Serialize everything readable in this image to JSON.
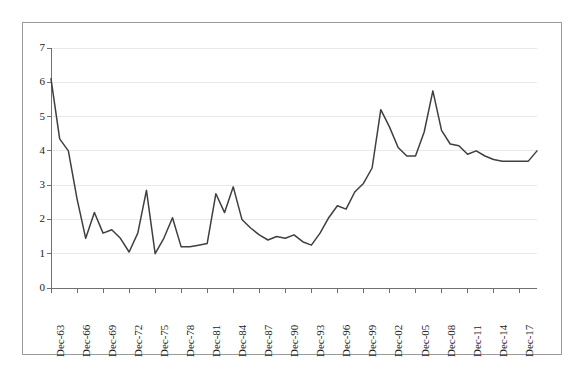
{
  "chart_data": {
    "type": "line",
    "title": "",
    "subtitle": "",
    "xlabel": "",
    "ylabel": "",
    "xlim": [
      "Dec-63",
      "Dec-19"
    ],
    "ylim": [
      0,
      7
    ],
    "y_ticks": [
      0,
      1,
      2,
      3,
      4,
      5,
      6,
      7
    ],
    "grid": "horizontal",
    "legend": "none",
    "line_color": "#3f3f3f",
    "grid_color": "#e9e9e9",
    "axis_color": "#6f6f6f",
    "x_tick_labels": [
      "Dec-63",
      "Dec-66",
      "Dec-69",
      "Dec-72",
      "Dec-75",
      "Dec-78",
      "Dec-81",
      "Dec-84",
      "Dec-87",
      "Dec-90",
      "Dec-93",
      "Dec-96",
      "Dec-99",
      "Dec-02",
      "Dec-05",
      "Dec-08",
      "Dec-11",
      "Dec-14",
      "Dec-17"
    ],
    "x_tick_interval_years": 3,
    "x": [
      "Dec-63",
      "Dec-64",
      "Dec-65",
      "Dec-66",
      "Dec-67",
      "Dec-68",
      "Dec-69",
      "Dec-70",
      "Dec-71",
      "Dec-72",
      "Dec-73",
      "Dec-74",
      "Dec-75",
      "Dec-76",
      "Dec-77",
      "Dec-78",
      "Dec-79",
      "Dec-80",
      "Dec-81",
      "Dec-82",
      "Dec-83",
      "Dec-84",
      "Dec-85",
      "Dec-86",
      "Dec-87",
      "Dec-88",
      "Dec-89",
      "Dec-90",
      "Dec-91",
      "Dec-92",
      "Dec-93",
      "Dec-94",
      "Dec-95",
      "Dec-96",
      "Dec-97",
      "Dec-98",
      "Dec-99",
      "Dec-00",
      "Dec-01",
      "Dec-02",
      "Dec-03",
      "Dec-04",
      "Dec-05",
      "Dec-06",
      "Dec-07",
      "Dec-08",
      "Dec-09",
      "Dec-10",
      "Dec-11",
      "Dec-12",
      "Dec-13",
      "Dec-14",
      "Dec-15",
      "Dec-16",
      "Dec-17",
      "Dec-18",
      "Dec-19"
    ],
    "values": [
      6.1,
      4.35,
      4.0,
      2.6,
      1.45,
      2.2,
      1.6,
      1.7,
      1.45,
      1.05,
      1.6,
      2.85,
      1.0,
      1.45,
      2.05,
      1.2,
      1.2,
      1.25,
      1.3,
      2.75,
      2.2,
      2.95,
      2.0,
      1.75,
      1.55,
      1.4,
      1.5,
      1.45,
      1.55,
      1.35,
      1.25,
      1.6,
      2.05,
      2.4,
      2.3,
      2.8,
      3.05,
      3.5,
      5.2,
      4.7,
      4.1,
      3.85,
      3.85,
      4.55,
      5.75,
      4.6,
      4.2,
      4.15,
      3.9,
      4.0,
      3.85,
      3.75,
      3.7,
      3.7,
      3.7,
      3.7,
      4.0
    ]
  }
}
